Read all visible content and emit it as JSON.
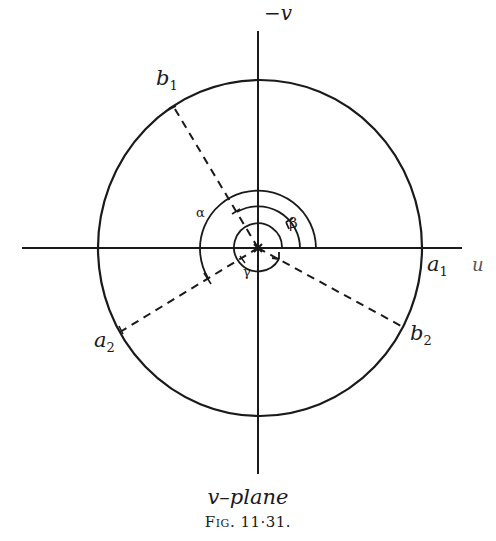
{
  "diagram": {
    "axis_labels": {
      "vertical": "−v",
      "horizontal": "u"
    },
    "points": {
      "a1": {
        "base": "a",
        "sub": "1"
      },
      "a2": {
        "base": "a",
        "sub": "2"
      },
      "b1": {
        "base": "b",
        "sub": "1"
      },
      "b2": {
        "base": "b",
        "sub": "2"
      }
    },
    "angles": {
      "alpha": "α",
      "beta": "β",
      "gamma": "γ"
    },
    "colors": {
      "ink": "#1a1a1a",
      "background": "#ffffff"
    }
  },
  "caption": {
    "plane": "v–plane",
    "figure": "Fig. 11·31."
  }
}
